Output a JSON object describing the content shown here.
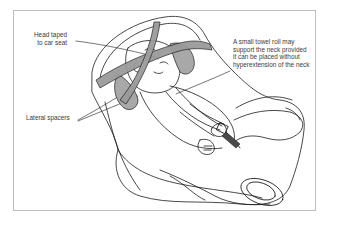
{
  "figure": {
    "colors": {
      "outline": "#1a1a1a",
      "tape_fill": "#9a9a9a",
      "spacer_fill": "#a8a8a8",
      "frame_border": "#bdbdbd",
      "label_text": "#3a3a3a"
    },
    "labels": {
      "head_taped": {
        "lines": [
          "Head taped",
          "to car seat"
        ]
      },
      "towel_roll": {
        "lines": [
          "A small towel roll may",
          "support the neck provided",
          "it can be placed without",
          "hyperextension of the neck"
        ]
      },
      "lateral_spacers": {
        "lines": [
          "Lateral spacers"
        ]
      }
    }
  }
}
